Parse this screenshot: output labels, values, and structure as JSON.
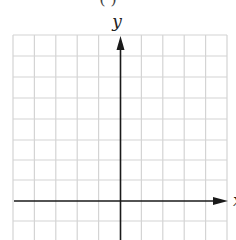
{
  "figure": {
    "caption_partial": "( )",
    "y_axis_label": "y",
    "x_axis_label": "x",
    "grid": {
      "columns": 10,
      "rows_visible": 10,
      "line_color": "#d4d4d4",
      "axis_color": "#1a1a1a"
    }
  }
}
